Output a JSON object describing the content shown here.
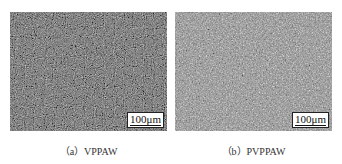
{
  "figure": {
    "panels": [
      {
        "id": "a",
        "caption": "（a）VPPAW",
        "scale_bar": "100μm",
        "tone": "#6a6a6a"
      },
      {
        "id": "b",
        "caption": "（b）PVPPAW",
        "scale_bar": "100μm",
        "tone": "#8a8a8a"
      }
    ]
  }
}
